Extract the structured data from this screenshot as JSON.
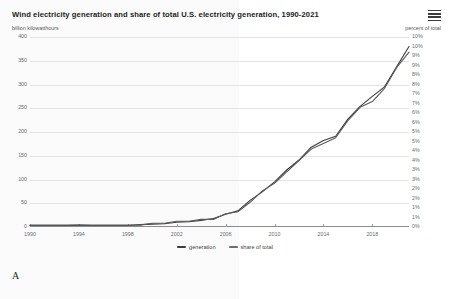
{
  "figure": {
    "label": "A",
    "menu_icon": "hamburger-menu-icon"
  },
  "chart_data": {
    "type": "line",
    "title": "Wind electricity generation and share of total U.S. electricity generation, 1990-2021",
    "subtitle": "",
    "xlabel": "",
    "ylabel": "billion kilowatthours",
    "y2label": "percent of total",
    "grid": true,
    "legend_position": "bottom",
    "xlim": [
      1990,
      2021
    ],
    "ylim": [
      0,
      400
    ],
    "y2lim": [
      0,
      10
    ],
    "xticks": [
      "1990",
      "1994",
      "1998",
      "2002",
      "2006",
      "2010",
      "2014",
      "2018"
    ],
    "xtick_values": [
      1990,
      1994,
      1998,
      2002,
      2006,
      2010,
      2014,
      2018
    ],
    "yticks": [
      "0",
      "50",
      "100",
      "150",
      "200",
      "250",
      "300",
      "350",
      "400"
    ],
    "ytick_values": [
      0,
      50,
      100,
      150,
      200,
      250,
      300,
      350,
      400
    ],
    "y2ticks": [
      "0%",
      "1%",
      "1%",
      "2%",
      "2%",
      "3%",
      "3%",
      "4%",
      "4%",
      "5%",
      "5%",
      "6%",
      "6%",
      "7%",
      "7%",
      "8%",
      "8%",
      "9%",
      "9%",
      "10%",
      "10%"
    ],
    "y2tick_values": [
      0,
      0.5,
      1,
      1.5,
      2,
      2.5,
      3,
      3.5,
      4,
      4.5,
      5,
      5.5,
      6,
      6.5,
      7,
      7.5,
      8,
      8.5,
      9,
      9.5,
      10
    ],
    "x": [
      1990,
      1991,
      1992,
      1993,
      1994,
      1995,
      1996,
      1997,
      1998,
      1999,
      2000,
      2001,
      2002,
      2003,
      2004,
      2005,
      2006,
      2007,
      2008,
      2009,
      2010,
      2011,
      2012,
      2013,
      2014,
      2015,
      2016,
      2017,
      2018,
      2019,
      2020,
      2021
    ],
    "series": [
      {
        "name": "generation",
        "axis": "left",
        "units": "billion kilowatthours",
        "color": "#3c3c3c",
        "values": [
          3,
          3,
          3,
          3,
          4,
          3,
          3,
          3,
          3,
          5,
          6,
          7,
          10,
          11,
          14,
          18,
          27,
          34,
          56,
          74,
          95,
          120,
          141,
          168,
          182,
          191,
          227,
          254,
          275,
          295,
          338,
          380
        ]
      },
      {
        "name": "share of total",
        "axis": "right",
        "units": "percent of total",
        "color": "#5a5a5a",
        "values": [
          0.1,
          0.1,
          0.1,
          0.1,
          0.1,
          0.1,
          0.1,
          0.1,
          0.1,
          0.1,
          0.2,
          0.2,
          0.3,
          0.3,
          0.4,
          0.4,
          0.7,
          0.8,
          1.3,
          1.9,
          2.3,
          2.9,
          3.5,
          4.1,
          4.4,
          4.7,
          5.6,
          6.3,
          6.6,
          7.3,
          8.4,
          9.2
        ]
      }
    ],
    "annotations": []
  },
  "legend": {
    "items": [
      {
        "label": "generation",
        "color": "#3c3c3c"
      },
      {
        "label": "share of total",
        "color": "#6d6d6d"
      }
    ]
  }
}
